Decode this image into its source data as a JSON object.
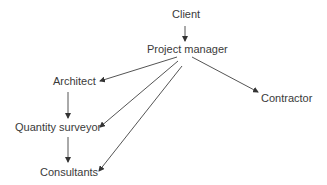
{
  "diagram": {
    "type": "hierarchy",
    "nodes": {
      "client": "Client",
      "project_manager": "Project manager",
      "architect": "Architect",
      "quantity_surveyor": "Quantity surveyor",
      "consultants": "Consultants",
      "contractor": "Contractor"
    },
    "edges": [
      {
        "from": "Client",
        "to": "Project manager"
      },
      {
        "from": "Project manager",
        "to": "Architect"
      },
      {
        "from": "Project manager",
        "to": "Quantity surveyor"
      },
      {
        "from": "Project manager",
        "to": "Consultants"
      },
      {
        "from": "Project manager",
        "to": "Contractor"
      },
      {
        "from": "Architect",
        "to": "Quantity surveyor"
      },
      {
        "from": "Quantity surveyor",
        "to": "Consultants"
      }
    ],
    "colors": {
      "text": "#3a3a3a",
      "line": "#555555",
      "background": "#ffffff"
    }
  }
}
